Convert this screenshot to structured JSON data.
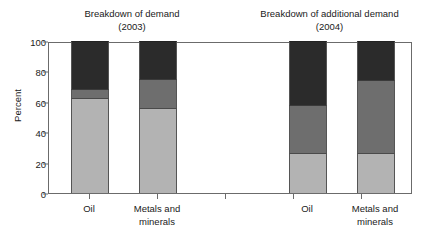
{
  "chart_data": {
    "type": "bar",
    "subtype": "stacked-bar",
    "title": "",
    "xlabel": "",
    "ylabel": "Percent",
    "ylim": [
      0,
      100
    ],
    "yticks": [
      0,
      20,
      40,
      60,
      80,
      100
    ],
    "grid": false,
    "legend": "none",
    "panels": [
      {
        "title_line1": "Breakdown of demand",
        "title_line2": "(2003)",
        "categories": [
          "Oil",
          "Metals and minerals"
        ],
        "series": [
          {
            "name": "bottom-light",
            "values": [
              62.5,
              55.6
            ]
          },
          {
            "name": "middle-gray",
            "values": [
              5.9,
              19.4
            ]
          },
          {
            "name": "top-dark",
            "values": [
              31.6,
              25.0
            ]
          }
        ]
      },
      {
        "title_line1": "Breakdown of additional demand",
        "title_line2": "(2004)",
        "categories": [
          "Oil",
          "Metals and minerals"
        ],
        "series": [
          {
            "name": "bottom-light",
            "values": [
              26.6,
              26.3
            ]
          },
          {
            "name": "middle-gray",
            "values": [
              31.6,
              48.0
            ]
          },
          {
            "name": "top-dark",
            "values": [
              41.8,
              25.7
            ]
          }
        ]
      }
    ],
    "colors": {
      "bottom_light": "#b3b3b3",
      "middle_gray": "#6e6e6e",
      "top_dark": "#2b2b2b",
      "axis": "#6b6b6b",
      "text": "#1a1a1a",
      "background": "#ffffff"
    }
  },
  "axis": {
    "ylabel": "Percent",
    "ytick_labels": [
      "100",
      "80",
      "60",
      "40",
      "20",
      "0"
    ]
  },
  "panel_left": {
    "title_line1": "Breakdown of demand",
    "title_line2": "(2003)",
    "cat1_line1": "Oil",
    "cat1_line2": "",
    "cat2_line1": "Metals and",
    "cat2_line2": "minerals"
  },
  "panel_right": {
    "title_line1": "Breakdown of additional demand",
    "title_line2": "(2004)",
    "cat1_line1": "Oil",
    "cat1_line2": "",
    "cat2_line1": "Metals and",
    "cat2_line2": "minerals"
  }
}
